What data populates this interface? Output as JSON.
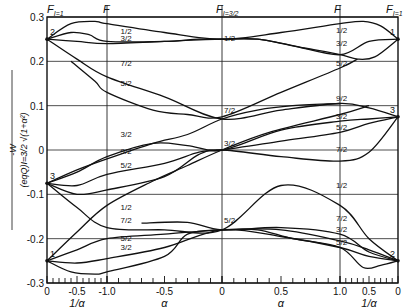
{
  "chart_data": {
    "type": "line",
    "title": "",
    "ylabel": "-W / ((eqQ)_{I=3/2} √(1+α²))",
    "ylim": [
      -0.3,
      0.3
    ],
    "yticks": [
      0.3,
      0.2,
      0.1,
      0,
      -0.1,
      -0.2,
      -0.3
    ],
    "ytick_labels": [
      "0.3",
      "0.2",
      "0.1",
      "0",
      "-0.1",
      "-0.2",
      "-0.3"
    ],
    "grid": true,
    "x_sections": [
      {
        "name": "1/α",
        "range": [
          0,
          1
        ],
        "direction": "0 → -1.0",
        "tick_labels": [
          "0",
          "-0.5",
          "-1.0"
        ],
        "xlabel": "1/α"
      },
      {
        "name": "α",
        "range": [
          -1,
          0
        ],
        "tick_labels": [
          "-1.0",
          "-0.5",
          "0"
        ],
        "xlabel": "α"
      },
      {
        "name": "α",
        "range": [
          0,
          1
        ],
        "tick_labels": [
          "0",
          "0.5",
          "1.0"
        ],
        "xlabel": "α"
      },
      {
        "name": "1/α",
        "range": [
          1,
          0
        ],
        "tick_labels": [
          "1.0",
          "0.5",
          "0"
        ],
        "xlabel": "1/α"
      }
    ],
    "top_labels": [
      {
        "text": "F_{I=1}",
        "position": "left edge"
      },
      {
        "text": "F",
        "position": "α=-1"
      },
      {
        "text": "F_{I=3/2}",
        "position": "α=0"
      },
      {
        "text": "F",
        "position": "α=1"
      },
      {
        "text": "F_{I=1}",
        "position": "right edge"
      }
    ],
    "x_coord_note": "X in [-2,2]: -2 = 1/α=0 (left), -1 = α=-1, 0 = α=0, 1 = α=1, 2 = 1/α=0 (right)",
    "edge_points": [
      {
        "label": "2",
        "X": -2,
        "y": 0.25
      },
      {
        "label": "3",
        "X": -2,
        "y": -0.075
      },
      {
        "label": "1",
        "X": -2,
        "y": -0.25
      },
      {
        "label": "1",
        "X": 2,
        "y": 0.25
      },
      {
        "label": "3",
        "X": 2,
        "y": 0.075
      },
      {
        "label": "2",
        "X": 2,
        "y": -0.25
      }
    ],
    "series": [
      {
        "name": "1/2 top",
        "points": [
          [
            -2,
            0.25
          ],
          [
            -1.6,
            0.285
          ],
          [
            -1.2,
            0.29
          ],
          [
            -1,
            0.285
          ],
          [
            -0.5,
            0.265
          ],
          [
            0,
            0.25
          ],
          [
            0.5,
            0.265
          ],
          [
            1,
            0.285
          ],
          [
            1.4,
            0.29
          ],
          [
            1.7,
            0.28
          ],
          [
            2,
            0.25
          ]
        ]
      },
      {
        "name": "3/2 upper",
        "points": [
          [
            -2,
            0.25
          ],
          [
            -1.6,
            0.265
          ],
          [
            -1.3,
            0.26
          ],
          [
            -1,
            0.245
          ],
          [
            -0.5,
            0.245
          ],
          [
            -0.2,
            0.25
          ],
          [
            0,
            0.25
          ],
          [
            0.3,
            0.25
          ],
          [
            0.6,
            0.235
          ],
          [
            1,
            0.215
          ],
          [
            1.5,
            0.245
          ],
          [
            2,
            0.25
          ]
        ]
      },
      {
        "name": "3/2 mid",
        "points": [
          [
            -2,
            0.25
          ],
          [
            -1.5,
            0.245
          ],
          [
            -1,
            0.24
          ],
          [
            -0.5,
            0.245
          ],
          [
            0,
            0.25
          ],
          [
            0.3,
            0.25
          ],
          [
            0.7,
            0.23
          ],
          [
            1,
            0.215
          ],
          [
            1.3,
            0.205
          ],
          [
            1.6,
            0.21
          ],
          [
            2,
            0.25
          ]
        ]
      },
      {
        "name": "7/2 line",
        "points": [
          [
            -2,
            0.25
          ],
          [
            -1.5,
            0.205
          ],
          [
            -1,
            0.165
          ],
          [
            -0.5,
            0.12
          ],
          [
            0,
            0.07
          ],
          [
            0.5,
            0.09
          ],
          [
            1,
            0.105
          ],
          [
            1.5,
            0.095
          ],
          [
            2,
            0.075
          ]
        ]
      },
      {
        "name": "5/2 descending",
        "points": [
          [
            -1.6,
            0.2
          ],
          [
            -1.2,
            0.155
          ],
          [
            -1,
            0.13
          ],
          [
            -0.6,
            0.09
          ],
          [
            -0.3,
            0.08
          ],
          [
            0,
            0.075
          ],
          [
            0.5,
            0.13
          ],
          [
            1,
            0.185
          ],
          [
            1.3,
            0.205
          ]
        ]
      },
      {
        "name": "3/2 crossing",
        "points": [
          [
            -2,
            -0.075
          ],
          [
            -1.5,
            -0.045
          ],
          [
            -1,
            -0.02
          ],
          [
            -0.6,
            0.015
          ],
          [
            -0.3,
            0.035
          ],
          [
            0,
            0.07
          ],
          [
            0.3,
            0.09
          ],
          [
            0.6,
            0.1
          ],
          [
            1,
            0.105
          ]
        ]
      },
      {
        "name": "9/2",
        "points": [
          [
            -2,
            -0.075
          ],
          [
            -1.5,
            -0.05
          ],
          [
            -1,
            -0.015
          ],
          [
            -0.6,
            0.015
          ],
          [
            -0.3,
            0.01
          ],
          [
            0,
            0
          ],
          [
            0.5,
            0.045
          ],
          [
            1,
            0.065
          ],
          [
            1.5,
            0.07
          ],
          [
            2,
            0.075
          ]
        ]
      },
      {
        "name": "5/2 mid",
        "points": [
          [
            -2,
            -0.075
          ],
          [
            -1.5,
            -0.08
          ],
          [
            -1,
            -0.055
          ],
          [
            -0.5,
            -0.03
          ],
          [
            -0.2,
            -0.005
          ],
          [
            0,
            0
          ],
          [
            0.5,
            0.02
          ],
          [
            1,
            0.04
          ],
          [
            1.5,
            0.06
          ],
          [
            2,
            0.075
          ]
        ]
      },
      {
        "name": "7/2 mid",
        "points": [
          [
            -2,
            -0.075
          ],
          [
            -1.5,
            -0.1
          ],
          [
            -1,
            -0.09
          ],
          [
            -0.5,
            -0.06
          ],
          [
            -0.2,
            -0.01
          ],
          [
            0,
            0
          ],
          [
            0.5,
            -0.015
          ],
          [
            1,
            -0.025
          ],
          [
            1.5,
            -0.005
          ],
          [
            2,
            0.075
          ]
        ]
      },
      {
        "name": "1/2 diagonal",
        "points": [
          [
            -2,
            -0.075
          ],
          [
            -1.5,
            -0.13
          ],
          [
            -1,
            -0.175
          ],
          [
            -0.5,
            -0.18
          ],
          [
            0,
            -0.18
          ],
          [
            0.5,
            -0.08
          ],
          [
            1,
            -0.125
          ],
          [
            1.5,
            -0.2
          ],
          [
            2,
            -0.25
          ]
        ]
      },
      {
        "name": "7/2 low",
        "points": [
          [
            -2,
            -0.25
          ],
          [
            -1.5,
            -0.185
          ],
          [
            -1,
            -0.125
          ],
          [
            -0.6,
            -0.07
          ],
          [
            -0.3,
            -0.035
          ],
          [
            0,
            0
          ],
          [
            0.4,
            0.04
          ],
          [
            1,
            0.08
          ],
          [
            1.5,
            0.1
          ]
        ]
      },
      {
        "name": "5/2 low",
        "points": [
          [
            -2,
            -0.25
          ],
          [
            -1.5,
            -0.225
          ],
          [
            -1,
            -0.2
          ],
          [
            -0.5,
            -0.19
          ],
          [
            0,
            -0.18
          ],
          [
            0.5,
            -0.18
          ],
          [
            1,
            -0.205
          ],
          [
            1.5,
            -0.225
          ],
          [
            2,
            -0.25
          ]
        ]
      },
      {
        "name": "3/2 low",
        "points": [
          [
            -2,
            -0.25
          ],
          [
            -1.5,
            -0.255
          ],
          [
            -1,
            -0.245
          ],
          [
            -0.5,
            -0.22
          ],
          [
            0,
            -0.18
          ],
          [
            0.5,
            -0.195
          ],
          [
            1,
            -0.22
          ],
          [
            1.5,
            -0.24
          ],
          [
            2,
            -0.25
          ]
        ]
      },
      {
        "name": "1 bottom",
        "points": [
          [
            -2,
            -0.25
          ],
          [
            -1.6,
            -0.275
          ],
          [
            -1.2,
            -0.28
          ],
          [
            -1,
            -0.275
          ],
          [
            -0.5,
            -0.24
          ],
          [
            -0.3,
            -0.19
          ],
          [
            0,
            -0.18
          ],
          [
            0.3,
            -0.18
          ],
          [
            0.6,
            -0.2
          ],
          [
            1,
            -0.22
          ],
          [
            1.4,
            -0.265
          ],
          [
            1.7,
            -0.26
          ],
          [
            2,
            -0.25
          ]
        ]
      },
      {
        "name": "7/2 crossing",
        "points": [
          [
            -0.7,
            -0.165
          ],
          [
            -0.3,
            -0.163
          ],
          [
            0,
            -0.18
          ],
          [
            0.5,
            -0.175
          ],
          [
            1,
            -0.19
          ],
          [
            1.5,
            -0.23
          ],
          [
            2,
            -0.25
          ]
        ]
      }
    ],
    "curve_labels": [
      {
        "text": "1/2",
        "X": -0.9,
        "y": 0.262
      },
      {
        "text": "3/2",
        "X": -0.9,
        "y": 0.245
      },
      {
        "text": "7/2",
        "X": -0.9,
        "y": 0.19
      },
      {
        "text": "5/2",
        "X": -0.9,
        "y": 0.145
      },
      {
        "text": "1/2",
        "X": 0,
        "y": 0.245
      },
      {
        "text": "7/2",
        "X": 0,
        "y": 0.083
      },
      {
        "text": "3/2",
        "X": -0.9,
        "y": 0.03
      },
      {
        "text": "9/2",
        "X": -0.9,
        "y": -0.01
      },
      {
        "text": "5/2",
        "X": -0.9,
        "y": -0.04
      },
      {
        "text": "3/2",
        "X": 0,
        "y": 0.01
      },
      {
        "text": "1/2",
        "X": -0.9,
        "y": -0.135
      },
      {
        "text": "7/2",
        "X": -0.9,
        "y": -0.165
      },
      {
        "text": "5/2",
        "X": -0.9,
        "y": -0.205
      },
      {
        "text": "3/2",
        "X": -0.9,
        "y": -0.225
      },
      {
        "text": "5/2",
        "X": 0,
        "y": -0.165
      },
      {
        "text": "1/2",
        "X": 0.95,
        "y": 0.265
      },
      {
        "text": "3/2",
        "X": 0.95,
        "y": 0.235
      },
      {
        "text": "5/2",
        "X": 0.95,
        "y": 0.19
      },
      {
        "text": "9/2",
        "X": 0.95,
        "y": 0.11
      },
      {
        "text": "3/2",
        "X": 0.95,
        "y": 0.07
      },
      {
        "text": "5/2",
        "X": 0.95,
        "y": 0.045
      },
      {
        "text": "7/2",
        "X": 0.95,
        "y": -0.005
      },
      {
        "text": "1/2",
        "X": 0.95,
        "y": -0.085
      },
      {
        "text": "7/2",
        "X": 0.95,
        "y": -0.16
      },
      {
        "text": "3/2",
        "X": 0.95,
        "y": -0.185
      },
      {
        "text": "5/2",
        "X": 0.95,
        "y": -0.215
      }
    ]
  }
}
